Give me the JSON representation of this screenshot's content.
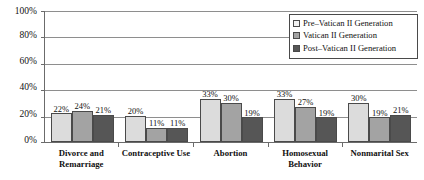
{
  "chart_data": {
    "type": "bar",
    "title": "",
    "subtitle": "",
    "xlabel": "",
    "ylabel": "",
    "ylim": [
      0,
      100
    ],
    "y_ticks": [
      "0%",
      "20%",
      "40%",
      "60%",
      "80%",
      "100%"
    ],
    "y_tick_values": [
      0,
      20,
      40,
      60,
      80,
      100
    ],
    "grid": true,
    "legend_position": "top-right",
    "categories": [
      "Divorce and Remarriage",
      "Contraceptive Use",
      "Abortion",
      "Homosexual Behavior",
      "Nonmarital Sex"
    ],
    "series": [
      {
        "name": "Pre–Vatican II Generation",
        "color": "#dcdcdc",
        "values": [
          22,
          20,
          33,
          33,
          30
        ],
        "labels": [
          "22%",
          "20%",
          "33%",
          "33%",
          "30%"
        ]
      },
      {
        "name": "Vatican II Generation",
        "color": "#a3a3a3",
        "values": [
          24,
          11,
          30,
          27,
          19
        ],
        "labels": [
          "24%",
          "11%",
          "30%",
          "27%",
          "19%"
        ]
      },
      {
        "name": "Post–Vatican II Generation",
        "color": "#565656",
        "values": [
          21,
          11,
          19,
          19,
          21
        ],
        "labels": [
          "21%",
          "11%",
          "19%",
          "19%",
          "21%"
        ]
      }
    ]
  }
}
